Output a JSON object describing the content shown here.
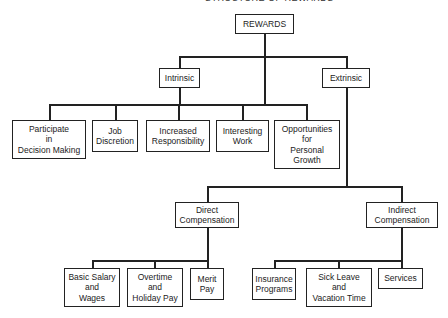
{
  "diagram": {
    "title": "STRUCTURE OF REWARDS",
    "root": "REWARDS",
    "intrinsic": {
      "label": "Intrinsic",
      "children": [
        "Participate\nin\nDecision Making",
        "Job\nDiscretion",
        "Increased\nResponsibility",
        "Interesting\nWork",
        "Opportunities\nfor\nPersonal\nGrowth"
      ]
    },
    "extrinsic": {
      "label": "Extrinsic",
      "direct": {
        "label": "Direct\nCompensation",
        "children": [
          "Basic Salary\nand\nWages",
          "Overtime\nand\nHoliday Pay",
          "Merit\nPay"
        ]
      },
      "indirect": {
        "label": "Indirect\nCompensation",
        "children": [
          "Insurance\nPrograms",
          "Sick Leave\nand\nVacation Time",
          "Services"
        ]
      }
    }
  }
}
